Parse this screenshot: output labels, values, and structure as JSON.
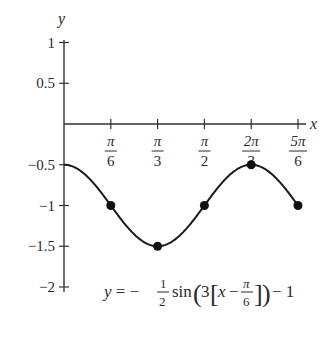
{
  "chart_data": {
    "type": "line",
    "title": "",
    "xlabel": "x",
    "ylabel": "y",
    "function": "y = -1/2 sin(3[x - pi/6]) - 1",
    "xlim": [
      0,
      2.618
    ],
    "ylim": [
      -2,
      1
    ],
    "grid": false,
    "x_ticks": [
      {
        "num": "π",
        "den": "6",
        "value": 0.5236
      },
      {
        "num": "π",
        "den": "3",
        "value": 1.0472
      },
      {
        "num": "π",
        "den": "2",
        "value": 1.5708
      },
      {
        "num": "2π",
        "den": "3",
        "value": 2.0944
      },
      {
        "num": "5π",
        "den": "6",
        "value": 2.618
      }
    ],
    "y_ticks": [
      {
        "label": "1",
        "value": 1
      },
      {
        "label": "0.5",
        "value": 0.5
      },
      {
        "label": "−0.5",
        "value": -0.5
      },
      {
        "label": "−1",
        "value": -1
      },
      {
        "label": "−1.5",
        "value": -1.5
      },
      {
        "label": "−2",
        "value": -2
      }
    ],
    "series": [
      {
        "name": "y = -1/2 sin(3[x - pi/6]) - 1",
        "x": [
          0,
          0.5236,
          1.0472,
          1.5708,
          2.0944,
          2.618
        ],
        "y": [
          -0.5,
          -1,
          -1.5,
          -1,
          -0.5,
          -1
        ],
        "marked_points_x": [
          0.5236,
          1.0472,
          1.5708,
          2.0944,
          2.618
        ],
        "marked_points_y": [
          -1,
          -1.5,
          -1,
          -0.5,
          -1
        ]
      }
    ],
    "equation_label": {
      "y_eq": "y = −",
      "half_num": "1",
      "half_den": "2",
      "sin": "sin",
      "three": "3",
      "x_minus": "x −",
      "pi_num": "π",
      "pi_den": "6",
      "tail": "− 1"
    }
  }
}
